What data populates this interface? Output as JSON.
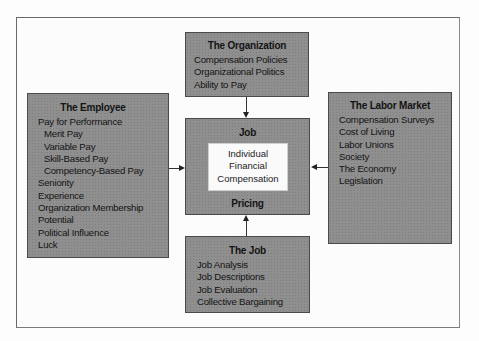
{
  "diagram": {
    "type": "influence-diagram",
    "boxes": {
      "organization": {
        "title": "The Organization",
        "items": [
          "Compensation Policies",
          "Organizational Politics",
          "Ability to Pay"
        ]
      },
      "employee": {
        "title": "The Employee",
        "items": [
          {
            "label": "Pay for Performance",
            "indent": false
          },
          {
            "label": "Merit Pay",
            "indent": true
          },
          {
            "label": "Variable Pay",
            "indent": true
          },
          {
            "label": "Skill-Based Pay",
            "indent": true
          },
          {
            "label": "Competency-Based Pay",
            "indent": true
          },
          {
            "label": "Seniority",
            "indent": false
          },
          {
            "label": "Experience",
            "indent": false
          },
          {
            "label": "Organization Membership",
            "indent": false
          },
          {
            "label": "Potential",
            "indent": false
          },
          {
            "label": "Political Influence",
            "indent": false
          },
          {
            "label": "Luck",
            "indent": false
          }
        ]
      },
      "center": {
        "top_label": "Job",
        "inner_lines": [
          "Individual",
          "Financial",
          "Compensation"
        ],
        "bottom_label": "Pricing"
      },
      "labor_market": {
        "title": "The Labor Market",
        "items": [
          "Compensation Surveys",
          "Cost of Living",
          "Labor Unions",
          "Society",
          "The Economy",
          "Legislation"
        ]
      },
      "job": {
        "title": "The Job",
        "items": [
          "Job Analysis",
          "Job Descriptions",
          "Job Evaluation",
          "Collective Bargaining"
        ]
      }
    },
    "arrows": [
      {
        "from": "The Organization",
        "to": "Job Pricing",
        "direction": "down"
      },
      {
        "from": "The Employee",
        "to": "Job Pricing",
        "direction": "right"
      },
      {
        "from": "The Labor Market",
        "to": "Job Pricing",
        "direction": "left"
      },
      {
        "from": "The Job",
        "to": "Job Pricing",
        "direction": "up"
      }
    ]
  }
}
